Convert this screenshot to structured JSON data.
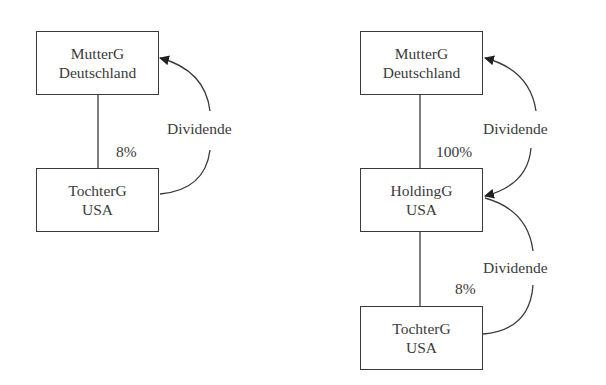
{
  "left": {
    "parent": {
      "line1": "MutterG",
      "line2": "Deutschland"
    },
    "child": {
      "line1": "TochterG",
      "line2": "USA"
    },
    "ownership": "8%",
    "flow_label": "Dividende"
  },
  "right": {
    "parent": {
      "line1": "MutterG",
      "line2": "Deutschland"
    },
    "holding": {
      "line1": "HoldingG",
      "line2": "USA"
    },
    "child": {
      "line1": "TochterG",
      "line2": "USA"
    },
    "ownership_top": "100%",
    "ownership_bottom": "8%",
    "flow_label_top": "Dividende",
    "flow_label_bottom": "Dividende"
  }
}
